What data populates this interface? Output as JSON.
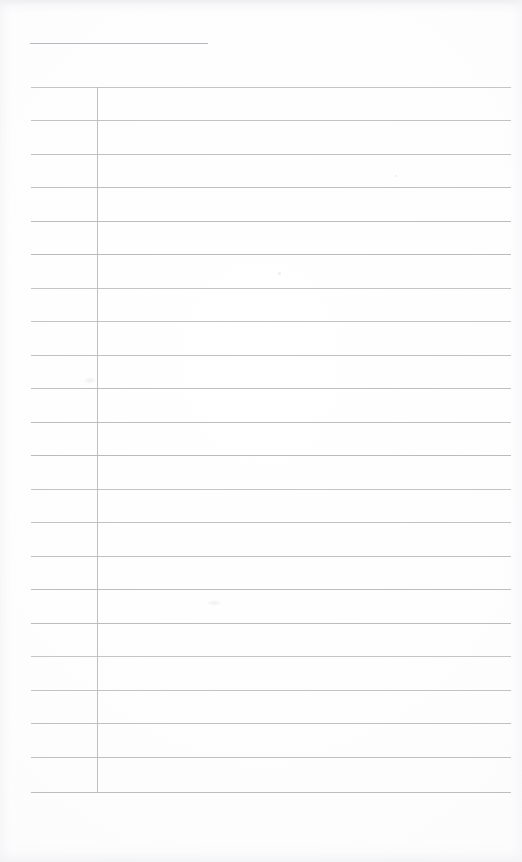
{
  "document": {
    "kind": "scanned-blank-ruled-page",
    "title_text": "",
    "body_text": "",
    "page_width": 522,
    "page_height": 862,
    "background_color": "#fdfdfe",
    "rule_color": "#b7b7bc",
    "margin_rule_color": "#b9b9be",
    "header_rule_color": "#b2b2b8"
  },
  "header_rule": {
    "x": 30,
    "y": 43,
    "width": 178,
    "label": ""
  },
  "margin_rule": {
    "x": 97,
    "y_start": 87,
    "y_end": 792,
    "label": ""
  },
  "grid": {
    "line_left": 31,
    "line_right": 511,
    "line_width": 480,
    "first_line_y": 87,
    "line_spacing": 33.57,
    "line_count": 22,
    "lines_y": [
      87,
      120,
      154,
      187,
      221,
      254,
      288,
      321,
      355,
      388,
      422,
      455,
      489,
      522,
      556,
      589,
      623,
      656,
      690,
      723,
      757,
      792
    ]
  },
  "rows": [
    {
      "index": 1,
      "left_cell": "",
      "right_cell": ""
    },
    {
      "index": 2,
      "left_cell": "",
      "right_cell": ""
    },
    {
      "index": 3,
      "left_cell": "",
      "right_cell": ""
    },
    {
      "index": 4,
      "left_cell": "",
      "right_cell": ""
    },
    {
      "index": 5,
      "left_cell": "",
      "right_cell": ""
    },
    {
      "index": 6,
      "left_cell": "",
      "right_cell": ""
    },
    {
      "index": 7,
      "left_cell": "",
      "right_cell": ""
    },
    {
      "index": 8,
      "left_cell": "",
      "right_cell": ""
    },
    {
      "index": 9,
      "left_cell": "",
      "right_cell": ""
    },
    {
      "index": 10,
      "left_cell": "",
      "right_cell": ""
    },
    {
      "index": 11,
      "left_cell": "",
      "right_cell": ""
    },
    {
      "index": 12,
      "left_cell": "",
      "right_cell": ""
    },
    {
      "index": 13,
      "left_cell": "",
      "right_cell": ""
    },
    {
      "index": 14,
      "left_cell": "",
      "right_cell": ""
    },
    {
      "index": 15,
      "left_cell": "",
      "right_cell": ""
    },
    {
      "index": 16,
      "left_cell": "",
      "right_cell": ""
    },
    {
      "index": 17,
      "left_cell": "",
      "right_cell": ""
    },
    {
      "index": 18,
      "left_cell": "",
      "right_cell": ""
    },
    {
      "index": 19,
      "left_cell": "",
      "right_cell": ""
    },
    {
      "index": 20,
      "left_cell": "",
      "right_cell": ""
    },
    {
      "index": 21,
      "left_cell": "",
      "right_cell": ""
    }
  ],
  "artifacts": [
    {
      "name": "speck-upper-mid",
      "x": 278,
      "y": 272,
      "w": 3,
      "h": 3,
      "type": "speck"
    },
    {
      "name": "smudge-left-col",
      "x": 83,
      "y": 377,
      "w": 14,
      "h": 7,
      "type": "smudge"
    },
    {
      "name": "smudge-mid-row",
      "x": 206,
      "y": 600,
      "w": 16,
      "h": 6,
      "type": "smudge"
    },
    {
      "name": "speck-right-edge",
      "x": 395,
      "y": 175,
      "w": 2,
      "h": 2,
      "type": "speck"
    }
  ]
}
